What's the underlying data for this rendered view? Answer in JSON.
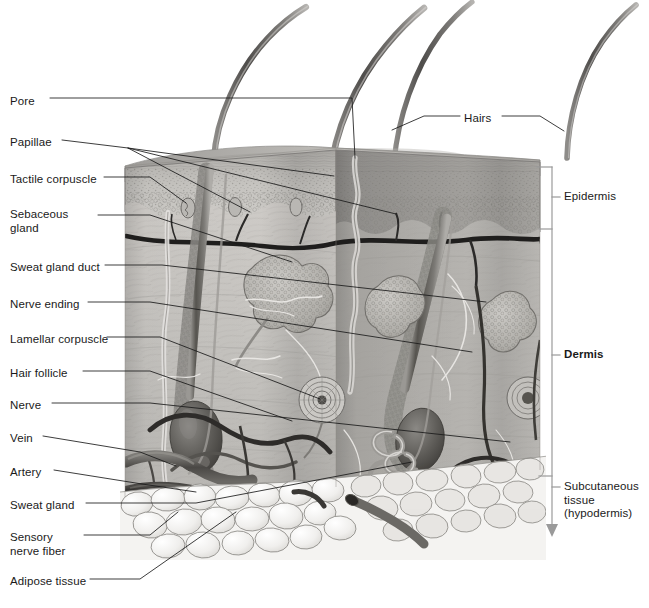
{
  "figure": {
    "type": "anatomical-illustration",
    "palette": {
      "background": "#ffffff",
      "leader_line": "#1a1a1a",
      "bracket_line": "#9a9a9a",
      "text": "#1a1a1a",
      "epidermis_light": "#c9c7c4",
      "epidermis_dark": "#8d8b88",
      "dermis_light": "#cfcdc9",
      "dermis_mid": "#b3b1ad",
      "dermis_dark": "#8f8d89",
      "adipose": "#f2f1ef",
      "adipose_line": "#8a8884",
      "vessel_dark": "#2b2b2b",
      "vessel_mid": "#6e6c69",
      "hair_shaft": "#6d6b68",
      "gland_fill": "#b8b6b2"
    }
  },
  "left_labels": [
    {
      "id": "pore",
      "text": "Pore",
      "x": 10,
      "y": 102,
      "lines": 1
    },
    {
      "id": "papillae",
      "text": "Papillae",
      "x": 10,
      "y": 143,
      "lines": 1
    },
    {
      "id": "tactile-corpuscle",
      "text": "Tactile corpuscle",
      "x": 10,
      "y": 180,
      "lines": 1
    },
    {
      "id": "sebaceous-gland",
      "text": "Sebaceous\ngland",
      "x": 10,
      "y": 212,
      "lines": 2
    },
    {
      "id": "sweat-gland-duct",
      "text": "Sweat gland duct",
      "x": 10,
      "y": 268,
      "lines": 1
    },
    {
      "id": "nerve-ending",
      "text": "Nerve ending",
      "x": 10,
      "y": 305,
      "lines": 1
    },
    {
      "id": "lamellar-corpuscle",
      "text": "Lamellar corpuscle",
      "x": 10,
      "y": 340,
      "lines": 1
    },
    {
      "id": "hair-follicle",
      "text": "Hair follicle",
      "x": 10,
      "y": 374,
      "lines": 1
    },
    {
      "id": "nerve",
      "text": "Nerve",
      "x": 10,
      "y": 406,
      "lines": 1
    },
    {
      "id": "vein",
      "text": "Vein",
      "x": 10,
      "y": 439,
      "lines": 1
    },
    {
      "id": "artery",
      "text": "Artery",
      "x": 10,
      "y": 473,
      "lines": 1
    },
    {
      "id": "sweat-gland",
      "text": "Sweat gland",
      "x": 10,
      "y": 506,
      "lines": 1
    },
    {
      "id": "sensory-nerve-fiber",
      "text": "Sensory\nnerve fiber",
      "x": 10,
      "y": 538,
      "lines": 2
    },
    {
      "id": "adipose-tissue",
      "text": "Adipose tissue",
      "x": 10,
      "y": 582,
      "lines": 1
    }
  ],
  "top_labels": [
    {
      "id": "hairs",
      "text": "Hairs",
      "x": 465,
      "y": 119,
      "lines": 1
    }
  ],
  "right_labels": [
    {
      "id": "epidermis",
      "text": "Epidermis",
      "x": 563,
      "y": 194,
      "bold": false,
      "lines": 1
    },
    {
      "id": "dermis",
      "text": "Dermis",
      "x": 563,
      "y": 352,
      "bold": true,
      "lines": 1
    },
    {
      "id": "subcutaneous",
      "text": "Subcutaneous\ntissue\n(hypodermis)",
      "x": 563,
      "y": 484,
      "bold": false,
      "lines": 3
    }
  ],
  "bracket": {
    "spine_x": 552,
    "top_y": 166,
    "bottom_y": 536,
    "arrow": "down",
    "ticks": [
      {
        "id": "tick-epidermis-top",
        "y": 167
      },
      {
        "id": "tick-epidermis-bottom",
        "y": 229
      },
      {
        "id": "tick-dermis-bottom",
        "y": 476
      }
    ],
    "stubs": [
      {
        "id": "stub-epidermis",
        "y": 197
      },
      {
        "id": "stub-dermis",
        "y": 355
      },
      {
        "id": "stub-subcutaneous",
        "y": 487
      }
    ]
  },
  "leaders": [
    {
      "id": "leader-pore",
      "path": "M 50,98 L 355,98 L 355,160"
    },
    {
      "id": "leader-papillae-a",
      "path": "M 62,140 L 128,148 L 248,213"
    },
    {
      "id": "leader-papillae-b",
      "path": "M 62,140 L 128,148 L 330,178"
    },
    {
      "id": "leader-papillae-c",
      "path": "M 62,140 L 128,148 L 395,216"
    },
    {
      "id": "leader-tactile-corpuscle",
      "path": "M 102,177 L 150,177 L 186,204"
    },
    {
      "id": "leader-sebaceous-gland",
      "path": "M 96,214 L 150,214 L 290,262"
    },
    {
      "id": "leader-sweat-gland-duct",
      "path": "M 103,265 L 160,265 L 480,300"
    },
    {
      "id": "leader-nerve-ending",
      "path": "M 86,302 L 150,302 L 470,350"
    },
    {
      "id": "leader-lamellar-corpuscle",
      "path": "M 105,337 L 160,337 L 325,400"
    },
    {
      "id": "leader-hair-follicle",
      "path": "M 81,371 L 150,371 L 290,420"
    },
    {
      "id": "leader-nerve",
      "path": "M 50,403 L 150,403 L 505,440"
    },
    {
      "id": "leader-vein",
      "path": "M 42,436 L 145,452 L 180,470"
    },
    {
      "id": "leader-artery",
      "path": "M 52,470 L 145,482 L 195,493"
    },
    {
      "id": "leader-sweat-gland",
      "path": "M 84,503 L 190,503 L 420,468"
    },
    {
      "id": "leader-sensory-nerve-fiber",
      "path": "M 82,535 L 150,535 L 175,512"
    },
    {
      "id": "leader-adipose-tissue",
      "path": "M 88,579 L 135,579 L 230,512"
    },
    {
      "id": "leader-hairs-left",
      "path": "M 460,116 L 425,116 L 395,128"
    },
    {
      "id": "leader-hairs-right",
      "path": "M 502,116 L 540,116 L 562,130"
    }
  ],
  "anatomy_regions": [
    {
      "id": "epidermis-layer",
      "label": "Epidermis",
      "y_top": 166,
      "y_bottom": 229
    },
    {
      "id": "dermis-layer",
      "label": "Dermis",
      "y_top": 229,
      "y_bottom": 476
    },
    {
      "id": "subcutaneous-layer",
      "label": "Subcutaneous tissue",
      "y_top": 476,
      "y_bottom": 560
    }
  ],
  "structures": [
    {
      "id": "hair-shaft-1",
      "name": "hair-shaft"
    },
    {
      "id": "hair-shaft-2",
      "name": "hair-shaft"
    },
    {
      "id": "hair-shaft-3",
      "name": "hair-shaft"
    },
    {
      "id": "hair-shaft-4",
      "name": "hair-shaft"
    },
    {
      "id": "hair-follicle-left",
      "name": "hair-follicle"
    },
    {
      "id": "hair-follicle-right",
      "name": "hair-follicle"
    },
    {
      "id": "sebaceous-gland-left",
      "name": "sebaceous-gland"
    },
    {
      "id": "sebaceous-gland-right",
      "name": "sebaceous-gland"
    },
    {
      "id": "lamellar-corpuscle-a",
      "name": "lamellar-corpuscle"
    },
    {
      "id": "lamellar-corpuscle-b",
      "name": "lamellar-corpuscle"
    },
    {
      "id": "sweat-gland-coil-a",
      "name": "sweat-gland"
    },
    {
      "id": "sweat-gland-coil-b",
      "name": "sweat-gland"
    },
    {
      "id": "artery-vessel",
      "name": "artery"
    },
    {
      "id": "vein-vessel",
      "name": "vein"
    },
    {
      "id": "adipose-cells",
      "name": "adipose-tissue"
    }
  ]
}
